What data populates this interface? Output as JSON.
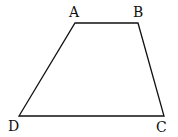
{
  "diagram": {
    "type": "trapezoid",
    "stroke_color": "#111111",
    "background": "#ffffff",
    "vertices": {
      "A": {
        "label": "A",
        "x": 75,
        "y": 23
      },
      "B": {
        "label": "B",
        "x": 138,
        "y": 23
      },
      "C": {
        "label": "C",
        "x": 164,
        "y": 116
      },
      "D": {
        "label": "D",
        "x": 19,
        "y": 116
      }
    },
    "edges": [
      "AB",
      "BC",
      "CD",
      "DA"
    ]
  }
}
